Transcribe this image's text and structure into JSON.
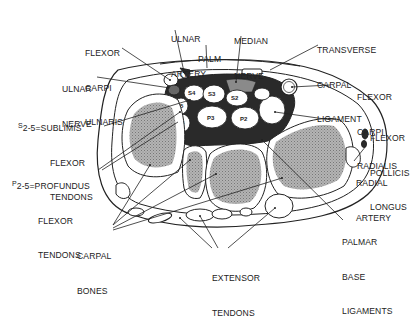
{
  "diagram": {
    "colors": {
      "outline": "#222222",
      "bone_fill": "#a8a8a8",
      "tunnel_fill": "#2a2a2a",
      "background": "#ffffff"
    },
    "labels": {
      "ulnar_artery": [
        "ULNAR",
        "ARTERY"
      ],
      "median_nerve": [
        "MEDIAN",
        "NERVE"
      ],
      "palm": [
        "PALM"
      ],
      "transverse_carpal_ligament": [
        "TRANSVERSE",
        "CARPAL",
        "LIGAMENT"
      ],
      "flexor_carpi_ulnaris": [
        "FLEXOR",
        "CARPI",
        "ULNARIS"
      ],
      "ulnar_nerve": [
        "ULNAR",
        "NERVE"
      ],
      "flexor_carpi_radialis": [
        "FLEXOR",
        "CARPI",
        "RADIALIS"
      ],
      "sublimis": {
        "prefix": "S",
        "line1": "2-5=SUBLIMIS",
        "line2": "FLEXOR",
        "line3": "TENDONS"
      },
      "profundus": {
        "prefix": "P",
        "line1": "2-5=PROFUNDUS",
        "line2": "FLEXOR",
        "line3": "TENDONS"
      },
      "flexor_pollicis_longus": [
        "FLEXOR",
        "POLLICIS",
        "LONGUS"
      ],
      "radial_artery": [
        "RADIAL",
        "ARTERY"
      ],
      "carpal_bones": [
        "CARPAL",
        "BONES"
      ],
      "palmar_base_ligaments": [
        "PALMAR",
        "BASE",
        "LIGAMENTS"
      ],
      "extensor_tendons": [
        "EXTENSOR",
        "TENDONS"
      ]
    },
    "tendon_tags": [
      "S4",
      "S3",
      "S2",
      "S5",
      "P4",
      "P3",
      "P2",
      "P5"
    ]
  }
}
